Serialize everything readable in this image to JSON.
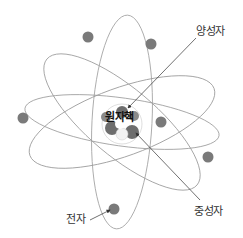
{
  "diagram": {
    "nucleus": {
      "label": "원자핵",
      "center": [
        122,
        122
      ]
    },
    "labels": {
      "proton": "양성자",
      "neutron": "중성자",
      "electron": "전자"
    },
    "orbits": [
      {
        "cx": 122,
        "cy": 122,
        "rx": 98,
        "ry": 24,
        "rotate": 8
      },
      {
        "cx": 122,
        "cy": 122,
        "rx": 98,
        "ry": 34,
        "rotate": -20
      },
      {
        "cx": 122,
        "cy": 122,
        "rx": 98,
        "ry": 34,
        "rotate": 40
      },
      {
        "cx": 122,
        "cy": 122,
        "rx": 107,
        "ry": 30,
        "rotate": 93
      }
    ],
    "electrons": [
      [
        88,
        37
      ],
      [
        151,
        44
      ],
      [
        23,
        118
      ],
      [
        161,
        122
      ],
      [
        208,
        157
      ],
      [
        114,
        209
      ]
    ],
    "colors": {
      "orbit": "#9a9a9a",
      "electron": "#7a7a7a",
      "particle": "#6e6e6e",
      "arrow": "#333333"
    }
  }
}
